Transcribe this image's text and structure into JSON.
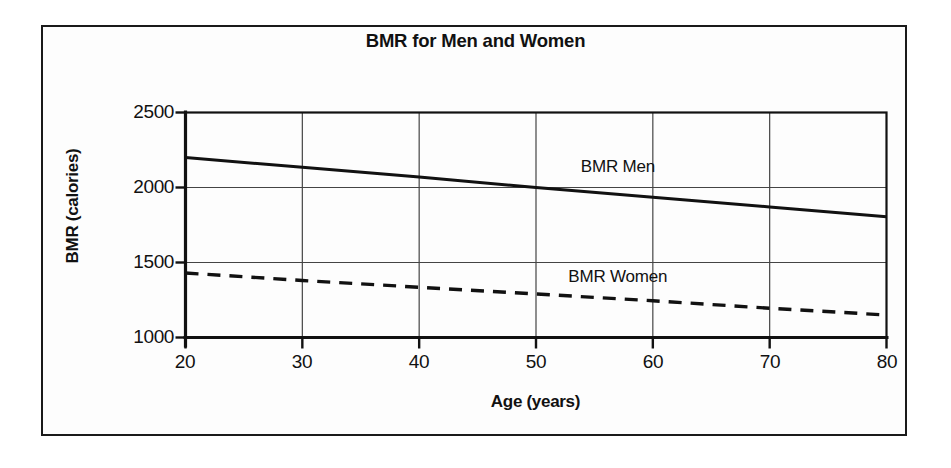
{
  "figure": {
    "background_color": "#fdfdfd",
    "frame_color": "#1a1a1a",
    "ink_color": "#111111"
  },
  "chart_data": {
    "type": "line",
    "title": "BMR for Men and Women",
    "xlabel": "Age (years)",
    "ylabel": "BMR (calories)",
    "xlim": [
      20,
      80
    ],
    "ylim": [
      1000,
      2500
    ],
    "xticks": [
      20,
      30,
      40,
      50,
      60,
      70,
      80
    ],
    "yticks": [
      1000,
      1500,
      2000,
      2500
    ],
    "xtick_labels": [
      "20",
      "30",
      "40",
      "50",
      "60",
      "70",
      "80"
    ],
    "ytick_labels": [
      "1000",
      "1500",
      "2000",
      "2500"
    ],
    "grid": true,
    "grid_color": "#444444",
    "legend_position": "inline-annotation",
    "x": [
      20,
      30,
      40,
      50,
      60,
      70,
      80
    ],
    "series": [
      {
        "name": "BMR Men",
        "label": "BMR Men",
        "style": "solid",
        "color": "#111111",
        "line_width": 3,
        "values": [
          2200,
          2135,
          2070,
          2000,
          1935,
          1870,
          1805
        ],
        "label_x": 57,
        "label_y": 2130
      },
      {
        "name": "BMR Women",
        "label": "BMR Women",
        "style": "dashed",
        "color": "#111111",
        "line_width": 3.4,
        "dash_pattern": "13,9",
        "values": [
          1430,
          1380,
          1335,
          1290,
          1245,
          1195,
          1150
        ],
        "label_x": 57,
        "label_y": 1400
      }
    ]
  }
}
